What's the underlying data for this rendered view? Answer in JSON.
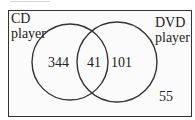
{
  "diagram": {
    "type": "venn",
    "sets": [
      {
        "name": "CD player",
        "label_line1": "CD",
        "label_line2": "player"
      },
      {
        "name": "DVD player",
        "label_line1": "DVD",
        "label_line2": "player"
      }
    ],
    "regions": {
      "cd_only": "344",
      "both": "41",
      "dvd_only": "101",
      "neither": "55"
    },
    "colors": {
      "stroke": "#333333",
      "text": "#222222",
      "background": "#fbfbfb"
    }
  }
}
